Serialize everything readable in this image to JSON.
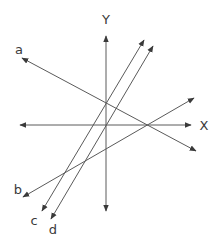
{
  "diagram": {
    "title": "",
    "line_color": "#5a5a5a",
    "axes": {
      "x": {
        "label": "X",
        "from": [
          20,
          125
        ],
        "to": [
          191,
          125
        ],
        "label_pos": [
          204,
          125
        ]
      },
      "y": {
        "label": "Y",
        "from": [
          106,
          211
        ],
        "to": [
          106,
          36
        ],
        "label_pos": [
          106,
          19
        ]
      }
    },
    "lines": [
      {
        "label": "a",
        "from": [
          196,
          151
        ],
        "to": [
          22,
          58
        ],
        "label_pos": [
          19,
          49
        ],
        "arrows": "both"
      },
      {
        "label": "b",
        "from": [
          23,
          197
        ],
        "to": [
          194,
          98
        ],
        "label_pos": [
          18,
          189
        ],
        "arrows": "both"
      },
      {
        "label": "c",
        "from": [
          42,
          211
        ],
        "to": [
          144,
          40
        ],
        "label_pos": [
          34,
          220
        ],
        "arrows": "both"
      },
      {
        "label": "d",
        "from": [
          51,
          219
        ],
        "to": [
          153,
          46
        ],
        "label_pos": [
          53,
          229
        ],
        "arrows": "both"
      }
    ]
  }
}
